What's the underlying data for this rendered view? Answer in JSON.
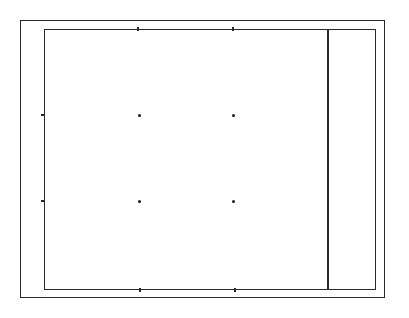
{
  "diagram": {
    "type": "plot-frame",
    "outer_frame": {
      "x": 20,
      "y": 20,
      "width": 365,
      "height": 278
    },
    "inner_frame": {
      "x": 44,
      "y": 29,
      "width": 332,
      "height": 261
    },
    "divider_x": 327,
    "line_color": "#2a2a2a",
    "points": [
      {
        "x": 139,
        "y": 115
      },
      {
        "x": 233,
        "y": 115
      },
      {
        "x": 139,
        "y": 201
      },
      {
        "x": 233,
        "y": 201
      }
    ],
    "ticks": {
      "top": [
        137,
        232
      ],
      "bottom": [
        139,
        234
      ],
      "left": [
        114,
        201
      ]
    }
  }
}
